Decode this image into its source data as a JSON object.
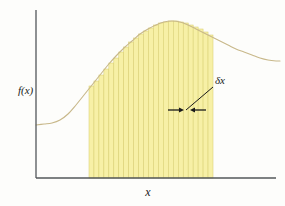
{
  "figure": {
    "axis_labels": {
      "y": "f(x)",
      "x": "x"
    },
    "annotation": {
      "label": "δx",
      "meaning": "width-of-one-strip",
      "leader_from": [
        215,
        84
      ],
      "leader_to": [
        186,
        110
      ],
      "arrow_left_tip": [
        184,
        110
      ],
      "arrow_right_tip": [
        190,
        110
      ]
    },
    "colors": {
      "strip_fill": "#f7f0a6",
      "strip_edge": "#d9cf72",
      "curve": "#c8b88a",
      "axis": "#53575a",
      "text": "#1a1a1a",
      "background": "#fdfdfb"
    },
    "geometry": {
      "y_axis_x": 36,
      "y_axis_top": 10,
      "baseline_y": 178,
      "x_axis_left": 36,
      "x_axis_right": 276,
      "shade_left": 89,
      "shade_right": 213,
      "strip_count": 25,
      "strip_width": 4.96
    }
  },
  "chart_data": {
    "type": "area",
    "xlabel": "x",
    "ylabel": "f(x)",
    "grid": false,
    "legend": null,
    "axis_style": "arrowless-L-axes",
    "annotations": [
      {
        "text": "δx",
        "kind": "strip-width-callout",
        "leader_line": true,
        "double_arrow": true
      }
    ],
    "curve": {
      "name": "f(x)",
      "description": "smooth sigmoid-then-decay curve: flat low plateau at left, rising inflection, rounded peak, slow decay to the right",
      "points_px": [
        [
          36,
          125
        ],
        [
          44,
          124
        ],
        [
          52,
          123
        ],
        [
          60,
          120
        ],
        [
          68,
          114
        ],
        [
          76,
          105
        ],
        [
          84,
          95
        ],
        [
          92,
          85
        ],
        [
          100,
          75
        ],
        [
          108,
          65
        ],
        [
          116,
          56
        ],
        [
          124,
          48
        ],
        [
          132,
          41
        ],
        [
          140,
          34
        ],
        [
          148,
          29
        ],
        [
          156,
          25
        ],
        [
          164,
          22
        ],
        [
          172,
          21
        ],
        [
          180,
          22
        ],
        [
          188,
          25
        ],
        [
          196,
          29
        ],
        [
          204,
          33
        ],
        [
          212,
          37
        ],
        [
          220,
          41
        ],
        [
          228,
          45
        ],
        [
          236,
          49
        ],
        [
          244,
          52
        ],
        [
          252,
          55
        ],
        [
          260,
          58
        ],
        [
          268,
          60
        ],
        [
          276,
          61
        ],
        [
          280,
          61
        ]
      ]
    },
    "shaded_region": {
      "x_start_px": 89,
      "x_end_px": 213,
      "baseline_px": 178,
      "fill": "#f7f0a6"
    },
    "strips": {
      "count": 25,
      "width_px": 4.96,
      "rule": "left-endpoint rectangles whose tops touch the curve",
      "top_y_px": [
        86,
        81,
        75,
        69,
        63,
        58,
        52,
        47,
        42,
        38,
        34,
        31,
        28,
        25,
        23,
        22,
        21,
        21,
        22,
        23,
        25,
        27,
        29,
        32,
        35
      ]
    }
  }
}
